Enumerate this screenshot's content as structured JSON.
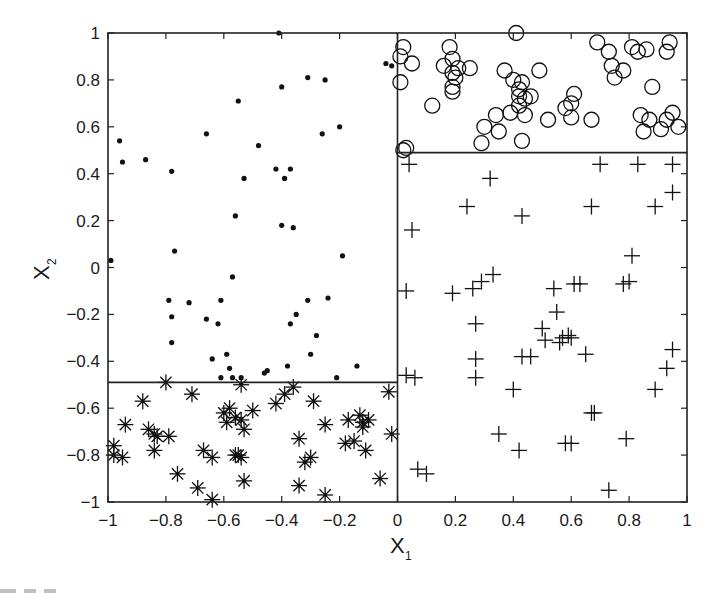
{
  "chart_data": {
    "type": "scatter",
    "title": "",
    "xlabel": "X",
    "xlabel_sub": "1",
    "ylabel": "X",
    "ylabel_sub": "2",
    "xlim": [
      -1,
      1
    ],
    "ylim": [
      -1,
      1
    ],
    "grid": false,
    "legend": null,
    "x_ticks": [
      -1,
      -0.8,
      -0.6,
      -0.4,
      -0.2,
      0,
      0.2,
      0.4,
      0.6,
      0.8,
      1
    ],
    "y_ticks": [
      -1,
      -0.8,
      -0.6,
      -0.4,
      -0.2,
      0,
      0.2,
      0.4,
      0.6,
      0.8,
      1
    ],
    "x_tick_labels": [
      "−1",
      "−0.8",
      "−0.6",
      "−0.4",
      "−0.2",
      "0",
      "0.2",
      "0.4",
      "0.6",
      "0.8",
      "1"
    ],
    "y_tick_labels": [
      "−1",
      "−0.8",
      "−0.6",
      "−0.4",
      "−0.2",
      "0",
      "0.2",
      "0.4",
      "0.6",
      "0.8",
      "1"
    ],
    "partitions": [
      {
        "name": "vertical-split",
        "x": 0,
        "y_range": [
          -1,
          1
        ]
      },
      {
        "name": "right-horizontal-split",
        "y": 0.49,
        "x_range": [
          0,
          1
        ]
      },
      {
        "name": "left-horizontal-split",
        "y": -0.49,
        "x_range": [
          -1,
          0
        ]
      }
    ],
    "series": [
      {
        "name": "region-upper-left",
        "marker": "dot",
        "points": [
          [
            -0.41,
            1.0
          ],
          [
            -0.99,
            0.03
          ],
          [
            -0.96,
            0.54
          ],
          [
            -0.95,
            0.45
          ],
          [
            -0.87,
            0.46
          ],
          [
            -0.78,
            0.41
          ],
          [
            -0.66,
            0.57
          ],
          [
            -0.55,
            0.71
          ],
          [
            -0.56,
            0.22
          ],
          [
            -0.42,
            0.42
          ],
          [
            -0.4,
            0.18
          ],
          [
            -0.39,
            0.38
          ],
          [
            -0.37,
            0.42
          ],
          [
            -0.36,
            0.17
          ],
          [
            -0.25,
            0.8
          ],
          [
            -0.2,
            0.6
          ],
          [
            -0.19,
            0.05
          ],
          [
            -0.04,
            0.87
          ],
          [
            -0.02,
            0.86
          ],
          [
            -0.4,
            0.77
          ],
          [
            -0.31,
            0.81
          ],
          [
            -0.48,
            0.52
          ],
          [
            -0.26,
            0.57
          ],
          [
            -0.53,
            0.38
          ],
          [
            -0.57,
            -0.04
          ],
          [
            -0.77,
            0.07
          ],
          [
            -0.79,
            -0.14
          ],
          [
            -0.72,
            -0.15
          ],
          [
            -0.61,
            -0.14
          ],
          [
            -0.78,
            -0.21
          ],
          [
            -0.66,
            -0.22
          ],
          [
            -0.78,
            -0.32
          ],
          [
            -0.62,
            -0.24
          ],
          [
            -0.64,
            -0.39
          ],
          [
            -0.59,
            -0.37
          ],
          [
            -0.37,
            -0.24
          ],
          [
            -0.35,
            -0.2
          ],
          [
            -0.31,
            -0.14
          ],
          [
            -0.28,
            -0.29
          ],
          [
            -0.3,
            -0.37
          ],
          [
            -0.24,
            -0.13
          ],
          [
            -0.38,
            -0.42
          ],
          [
            -0.46,
            -0.45
          ],
          [
            -0.45,
            -0.44
          ],
          [
            -0.61,
            -0.47
          ],
          [
            -0.58,
            -0.43
          ],
          [
            -0.57,
            -0.47
          ],
          [
            -0.21,
            -0.47
          ],
          [
            -0.14,
            -0.42
          ],
          [
            -0.54,
            -0.47
          ]
        ]
      },
      {
        "name": "region-upper-right",
        "marker": "circle",
        "points": [
          [
            0.02,
            0.94
          ],
          [
            0.01,
            0.9
          ],
          [
            0.05,
            0.87
          ],
          [
            0.01,
            0.79
          ],
          [
            0.16,
            0.86
          ],
          [
            0.19,
            0.89
          ],
          [
            0.18,
            0.94
          ],
          [
            0.19,
            0.83
          ],
          [
            0.2,
            0.81
          ],
          [
            0.21,
            0.85
          ],
          [
            0.25,
            0.85
          ],
          [
            0.19,
            0.77
          ],
          [
            0.19,
            0.75
          ],
          [
            0.12,
            0.69
          ],
          [
            0.41,
            1.0
          ],
          [
            0.4,
            0.8
          ],
          [
            0.42,
            0.76
          ],
          [
            0.44,
            0.72
          ],
          [
            0.42,
            0.73
          ],
          [
            0.42,
            0.69
          ],
          [
            0.39,
            0.66
          ],
          [
            0.37,
            0.84
          ],
          [
            0.43,
            0.79
          ],
          [
            0.49,
            0.84
          ],
          [
            0.46,
            0.73
          ],
          [
            0.34,
            0.65
          ],
          [
            0.3,
            0.6
          ],
          [
            0.44,
            0.65
          ],
          [
            0.35,
            0.58
          ],
          [
            0.43,
            0.54
          ],
          [
            0.52,
            0.63
          ],
          [
            0.61,
            0.74
          ],
          [
            0.6,
            0.7
          ],
          [
            0.6,
            0.64
          ],
          [
            0.58,
            0.68
          ],
          [
            0.67,
            0.63
          ],
          [
            0.74,
            0.86
          ],
          [
            0.73,
            0.92
          ],
          [
            0.69,
            0.96
          ],
          [
            0.75,
            0.81
          ],
          [
            0.78,
            0.84
          ],
          [
            0.81,
            0.94
          ],
          [
            0.83,
            0.92
          ],
          [
            0.86,
            0.93
          ],
          [
            0.94,
            0.96
          ],
          [
            0.93,
            0.92
          ],
          [
            0.88,
            0.77
          ],
          [
            0.84,
            0.65
          ],
          [
            0.87,
            0.63
          ],
          [
            0.93,
            0.63
          ],
          [
            0.95,
            0.66
          ],
          [
            0.85,
            0.58
          ],
          [
            0.91,
            0.59
          ],
          [
            0.97,
            0.6
          ],
          [
            0.29,
            0.53
          ],
          [
            0.03,
            0.51
          ],
          [
            0.02,
            0.5
          ]
        ]
      },
      {
        "name": "region-lower-right",
        "marker": "plus",
        "points": [
          [
            0.04,
            0.44
          ],
          [
            0.32,
            0.38
          ],
          [
            0.7,
            0.44
          ],
          [
            0.83,
            0.44
          ],
          [
            0.95,
            0.44
          ],
          [
            0.95,
            0.32
          ],
          [
            0.89,
            0.26
          ],
          [
            0.67,
            0.26
          ],
          [
            0.24,
            0.26
          ],
          [
            0.43,
            0.22
          ],
          [
            0.05,
            0.16
          ],
          [
            0.81,
            0.05
          ],
          [
            0.03,
            -0.1
          ],
          [
            0.19,
            -0.11
          ],
          [
            0.29,
            -0.06
          ],
          [
            0.33,
            -0.03
          ],
          [
            0.54,
            -0.09
          ],
          [
            0.61,
            -0.07
          ],
          [
            0.63,
            -0.07
          ],
          [
            0.78,
            -0.07
          ],
          [
            0.8,
            -0.06
          ],
          [
            0.55,
            -0.19
          ],
          [
            0.5,
            -0.26
          ],
          [
            0.51,
            -0.31
          ],
          [
            0.56,
            -0.32
          ],
          [
            0.57,
            -0.3
          ],
          [
            0.59,
            -0.29
          ],
          [
            0.6,
            -0.3
          ],
          [
            0.43,
            -0.38
          ],
          [
            0.46,
            -0.38
          ],
          [
            0.27,
            -0.24
          ],
          [
            0.27,
            -0.39
          ],
          [
            0.03,
            -0.46
          ],
          [
            0.06,
            -0.47
          ],
          [
            0.27,
            -0.47
          ],
          [
            0.4,
            -0.52
          ],
          [
            0.95,
            -0.35
          ],
          [
            0.93,
            -0.43
          ],
          [
            0.89,
            -0.52
          ],
          [
            0.35,
            -0.71
          ],
          [
            0.42,
            -0.78
          ],
          [
            0.58,
            -0.75
          ],
          [
            0.6,
            -0.75
          ],
          [
            0.67,
            -0.62
          ],
          [
            0.68,
            -0.62
          ],
          [
            0.79,
            -0.73
          ],
          [
            0.07,
            -0.86
          ],
          [
            0.1,
            -0.88
          ],
          [
            0.73,
            -0.95
          ],
          [
            0.26,
            -0.09
          ],
          [
            0.65,
            -0.37
          ]
        ]
      },
      {
        "name": "region-lower-left",
        "marker": "star",
        "points": [
          [
            -0.8,
            -0.49
          ],
          [
            -0.54,
            -0.5
          ],
          [
            -0.36,
            -0.51
          ],
          [
            -0.39,
            -0.54
          ],
          [
            -0.42,
            -0.58
          ],
          [
            -0.71,
            -0.54
          ],
          [
            -0.88,
            -0.57
          ],
          [
            -0.03,
            -0.53
          ],
          [
            -0.29,
            -0.57
          ],
          [
            -0.98,
            -0.76
          ],
          [
            -0.98,
            -0.8
          ],
          [
            -0.95,
            -0.81
          ],
          [
            -0.94,
            -0.67
          ],
          [
            -0.86,
            -0.69
          ],
          [
            -0.84,
            -0.71
          ],
          [
            -0.83,
            -0.72
          ],
          [
            -0.79,
            -0.72
          ],
          [
            -0.84,
            -0.78
          ],
          [
            -0.64,
            -0.81
          ],
          [
            -0.67,
            -0.78
          ],
          [
            -0.6,
            -0.62
          ],
          [
            -0.58,
            -0.6
          ],
          [
            -0.59,
            -0.66
          ],
          [
            -0.56,
            -0.64
          ],
          [
            -0.54,
            -0.65
          ],
          [
            -0.53,
            -0.69
          ],
          [
            -0.5,
            -0.61
          ],
          [
            -0.56,
            -0.8
          ],
          [
            -0.55,
            -0.8
          ],
          [
            -0.54,
            -0.81
          ],
          [
            -0.53,
            -0.91
          ],
          [
            -0.76,
            -0.88
          ],
          [
            -0.69,
            -0.94
          ],
          [
            -0.64,
            -0.99
          ],
          [
            -0.34,
            -0.73
          ],
          [
            -0.32,
            -0.83
          ],
          [
            -0.3,
            -0.81
          ],
          [
            -0.34,
            -0.93
          ],
          [
            -0.25,
            -0.67
          ],
          [
            -0.25,
            -0.97
          ],
          [
            -0.17,
            -0.65
          ],
          [
            -0.13,
            -0.63
          ],
          [
            -0.12,
            -0.66
          ],
          [
            -0.12,
            -0.68
          ],
          [
            -0.1,
            -0.65
          ],
          [
            -0.18,
            -0.75
          ],
          [
            -0.15,
            -0.74
          ],
          [
            -0.11,
            -0.78
          ],
          [
            -0.06,
            -0.9
          ],
          [
            -0.02,
            -0.71
          ]
        ]
      }
    ]
  },
  "axes": {
    "x_label": "X",
    "x_label_sub": "1",
    "y_label": "X",
    "y_label_sub": "2"
  }
}
